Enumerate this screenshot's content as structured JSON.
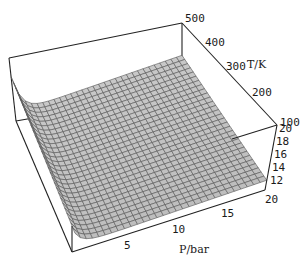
{
  "chart_data": {
    "type": "surface3d",
    "title": "",
    "xlabel": "P/bar",
    "ylabel": "T/K",
    "zlabel": "",
    "x_ticks": [
      5,
      10,
      15,
      20
    ],
    "y_ticks": [
      100,
      200,
      300,
      400,
      500
    ],
    "z_ticks": [
      12,
      14,
      16,
      18,
      20
    ],
    "xlim": [
      0,
      20
    ],
    "ylim": [
      100,
      500
    ],
    "zlim": [
      11,
      20
    ],
    "grid_size": [
      30,
      30
    ],
    "surface_color": "#c8c8c8",
    "mesh_color": "#555555"
  },
  "labels": {
    "x_axis": "P/bar",
    "y_axis": "T/K",
    "x_ticks": [
      "5",
      "10",
      "15",
      "20"
    ],
    "y_ticks": [
      "100",
      "200",
      "300",
      "400",
      "500"
    ],
    "z_ticks": [
      "12",
      "14",
      "16",
      "18",
      "20"
    ]
  }
}
